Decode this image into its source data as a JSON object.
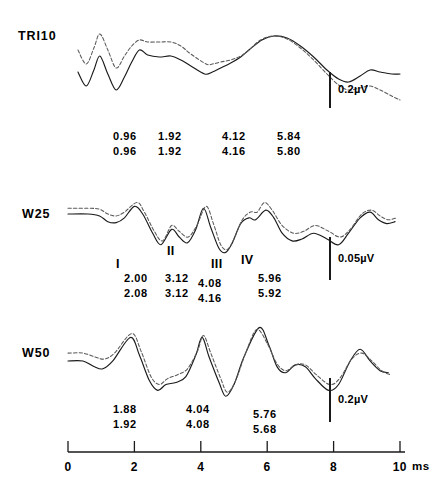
{
  "figure": {
    "type": "multi-panel-waveform",
    "background_color": "#ffffff",
    "solid_trace_color": "#1a1a1a",
    "dashed_trace_color": "#5a5a5a"
  },
  "axis": {
    "label_unit": "ms",
    "tick_labels": [
      "0",
      "2",
      "4",
      "6",
      "8",
      "10"
    ],
    "tick_values": [
      0,
      2,
      4,
      6,
      8,
      10
    ],
    "range": [
      0,
      10
    ],
    "pixel_x_start": 68,
    "pixel_x_end": 400
  },
  "panels": [
    {
      "id": "tri10",
      "title": "TRI10",
      "scale_bar": {
        "label": "0.2µV",
        "value": 0.2,
        "unit": "µV"
      },
      "latency_rows": [
        [
          "0.96",
          "1.92",
          "4.12",
          "5.84"
        ],
        [
          "0.96",
          "1.92",
          "4.16",
          "5.80"
        ]
      ],
      "peak_labels": []
    },
    {
      "id": "w25",
      "title": "W25",
      "scale_bar": {
        "label": "0.05µV",
        "value": 0.05,
        "unit": "µV"
      },
      "latency_rows": [
        [
          "2.00",
          "3.12",
          "4.08",
          "5.96"
        ],
        [
          "2.08",
          "3.12",
          "4.16",
          "5.92"
        ]
      ],
      "peak_labels": [
        "I",
        "II",
        "III",
        "IV"
      ]
    },
    {
      "id": "w50",
      "title": "W50",
      "scale_bar": {
        "label": "0.2µV",
        "value": 0.2,
        "unit": "µV"
      },
      "latency_rows": [
        [
          "1.88",
          "4.04",
          "5.76"
        ],
        [
          "1.92",
          "4.08",
          "5.68"
        ]
      ],
      "peak_labels": []
    }
  ],
  "chart_data": {
    "type": "line",
    "title": "",
    "xlabel": "ms",
    "ylabel": "",
    "xlim": [
      0,
      10
    ],
    "grid": false,
    "legend": "none",
    "panels": [
      {
        "name": "TRI10",
        "series": [
          {
            "name": "solid",
            "style": "solid",
            "points": [
              [
                0.3,
                40
              ],
              [
                0.55,
                26
              ],
              [
                0.78,
                42
              ],
              [
                0.96,
                56
              ],
              [
                1.2,
                38
              ],
              [
                1.45,
                22
              ],
              [
                1.7,
                35
              ],
              [
                1.92,
                50
              ],
              [
                2.15,
                62
              ],
              [
                2.4,
                57
              ],
              [
                2.75,
                55
              ],
              [
                3.1,
                56
              ],
              [
                3.4,
                52
              ],
              [
                3.7,
                46
              ],
              [
                4.12,
                38
              ],
              [
                4.35,
                40
              ],
              [
                4.6,
                44
              ],
              [
                4.9,
                49
              ],
              [
                5.2,
                55
              ],
              [
                5.45,
                62
              ],
              [
                5.84,
                72
              ],
              [
                6.2,
                76
              ],
              [
                6.6,
                74
              ],
              [
                7.0,
                66
              ],
              [
                7.4,
                55
              ],
              [
                7.8,
                42
              ],
              [
                8.15,
                33
              ],
              [
                8.45,
                30
              ],
              [
                8.8,
                36
              ],
              [
                9.1,
                42
              ],
              [
                9.4,
                40
              ],
              [
                9.75,
                38
              ],
              [
                10.0,
                38
              ]
            ]
          },
          {
            "name": "dashed",
            "style": "dashed",
            "points": [
              [
                0.3,
                62
              ],
              [
                0.55,
                48
              ],
              [
                0.78,
                64
              ],
              [
                0.96,
                78
              ],
              [
                1.2,
                62
              ],
              [
                1.45,
                44
              ],
              [
                1.7,
                56
              ],
              [
                1.92,
                66
              ],
              [
                2.15,
                72
              ],
              [
                2.4,
                70
              ],
              [
                2.75,
                70
              ],
              [
                3.1,
                70
              ],
              [
                3.4,
                66
              ],
              [
                3.7,
                58
              ],
              [
                4.16,
                48
              ],
              [
                4.35,
                48
              ],
              [
                4.6,
                50
              ],
              [
                4.9,
                52
              ],
              [
                5.2,
                56
              ],
              [
                5.45,
                62
              ],
              [
                5.8,
                72
              ],
              [
                6.2,
                76
              ],
              [
                6.6,
                73
              ],
              [
                7.0,
                64
              ],
              [
                7.4,
                52
              ],
              [
                7.8,
                38
              ],
              [
                8.15,
                27
              ],
              [
                8.45,
                22
              ],
              [
                8.8,
                24
              ],
              [
                9.1,
                26
              ],
              [
                9.4,
                22
              ],
              [
                9.75,
                16
              ],
              [
                10.0,
                12
              ]
            ]
          }
        ],
        "latency_markers": {
          "solid": [
            0.96,
            1.92,
            4.12,
            5.84
          ],
          "dashed": [
            0.96,
            1.92,
            4.16,
            5.8
          ]
        }
      },
      {
        "name": "W25",
        "series": [
          {
            "name": "solid",
            "style": "solid",
            "points": [
              [
                0.0,
                50
              ],
              [
                0.6,
                50
              ],
              [
                0.95,
                48
              ],
              [
                1.2,
                42
              ],
              [
                1.45,
                41
              ],
              [
                1.7,
                46
              ],
              [
                2.0,
                58
              ],
              [
                2.25,
                50
              ],
              [
                2.55,
                30
              ],
              [
                2.8,
                18
              ],
              [
                3.12,
                34
              ],
              [
                3.35,
                26
              ],
              [
                3.6,
                20
              ],
              [
                3.85,
                34
              ],
              [
                4.08,
                56
              ],
              [
                4.3,
                36
              ],
              [
                4.55,
                14
              ],
              [
                4.75,
                10
              ],
              [
                4.95,
                20
              ],
              [
                5.2,
                40
              ],
              [
                5.45,
                46
              ],
              [
                5.65,
                44
              ],
              [
                5.96,
                54
              ],
              [
                6.2,
                46
              ],
              [
                6.45,
                30
              ],
              [
                6.75,
                22
              ],
              [
                7.05,
                24
              ],
              [
                7.4,
                30
              ],
              [
                7.8,
                24
              ],
              [
                8.15,
                18
              ],
              [
                8.45,
                30
              ],
              [
                8.8,
                46
              ],
              [
                9.1,
                52
              ],
              [
                9.35,
                44
              ],
              [
                9.6,
                40
              ],
              [
                9.85,
                42
              ]
            ]
          },
          {
            "name": "dashed",
            "style": "dashed",
            "points": [
              [
                0.0,
                56
              ],
              [
                0.6,
                56
              ],
              [
                0.95,
                55
              ],
              [
                1.2,
                50
              ],
              [
                1.45,
                48
              ],
              [
                1.7,
                52
              ],
              [
                2.08,
                62
              ],
              [
                2.3,
                52
              ],
              [
                2.6,
                32
              ],
              [
                2.85,
                22
              ],
              [
                3.12,
                38
              ],
              [
                3.35,
                32
              ],
              [
                3.62,
                26
              ],
              [
                3.88,
                38
              ],
              [
                4.16,
                58
              ],
              [
                4.38,
                40
              ],
              [
                4.6,
                18
              ],
              [
                4.8,
                13
              ],
              [
                5.0,
                24
              ],
              [
                5.25,
                44
              ],
              [
                5.5,
                52
              ],
              [
                5.7,
                52
              ],
              [
                5.92,
                62
              ],
              [
                6.15,
                54
              ],
              [
                6.45,
                38
              ],
              [
                6.8,
                30
              ],
              [
                7.1,
                32
              ],
              [
                7.45,
                38
              ],
              [
                7.85,
                32
              ],
              [
                8.2,
                26
              ],
              [
                8.5,
                34
              ],
              [
                8.85,
                50
              ],
              [
                9.15,
                54
              ],
              [
                9.4,
                48
              ],
              [
                9.65,
                44
              ],
              [
                9.9,
                46
              ]
            ]
          }
        ],
        "latency_markers": {
          "solid": [
            2.0,
            3.12,
            4.08,
            5.96
          ],
          "dashed": [
            2.08,
            3.12,
            4.16,
            5.92
          ]
        },
        "peak_annotations": [
          {
            "label": "I",
            "latency": 1.95
          },
          {
            "label": "II",
            "latency": 3.1
          },
          {
            "label": "III",
            "latency": 4.25
          },
          {
            "label": "IV",
            "latency": 5.35
          }
        ]
      },
      {
        "name": "W50",
        "series": [
          {
            "name": "solid",
            "style": "solid",
            "points": [
              [
                0.0,
                48
              ],
              [
                0.45,
                48
              ],
              [
                0.8,
                42
              ],
              [
                1.05,
                40
              ],
              [
                1.35,
                48
              ],
              [
                1.88,
                72
              ],
              [
                2.15,
                54
              ],
              [
                2.45,
                28
              ],
              [
                2.7,
                18
              ],
              [
                2.95,
                24
              ],
              [
                3.25,
                26
              ],
              [
                3.55,
                32
              ],
              [
                3.85,
                54
              ],
              [
                4.04,
                72
              ],
              [
                4.25,
                52
              ],
              [
                4.55,
                26
              ],
              [
                4.75,
                12
              ],
              [
                5.0,
                24
              ],
              [
                5.3,
                52
              ],
              [
                5.76,
                82
              ],
              [
                6.05,
                64
              ],
              [
                6.3,
                42
              ],
              [
                6.55,
                36
              ],
              [
                6.85,
                44
              ],
              [
                7.15,
                42
              ],
              [
                7.45,
                30
              ],
              [
                7.85,
                18
              ],
              [
                8.15,
                24
              ],
              [
                8.5,
                48
              ],
              [
                8.8,
                60
              ],
              [
                9.1,
                48
              ],
              [
                9.4,
                38
              ],
              [
                9.65,
                36
              ]
            ]
          },
          {
            "name": "dashed",
            "style": "dashed",
            "points": [
              [
                0.0,
                56
              ],
              [
                0.45,
                56
              ],
              [
                0.82,
                52
              ],
              [
                1.1,
                50
              ],
              [
                1.4,
                56
              ],
              [
                1.92,
                76
              ],
              [
                2.2,
                58
              ],
              [
                2.5,
                32
              ],
              [
                2.75,
                24
              ],
              [
                3.0,
                30
              ],
              [
                3.3,
                34
              ],
              [
                3.6,
                40
              ],
              [
                3.9,
                58
              ],
              [
                4.08,
                74
              ],
              [
                4.3,
                56
              ],
              [
                4.6,
                30
              ],
              [
                4.8,
                16
              ],
              [
                5.05,
                28
              ],
              [
                5.35,
                56
              ],
              [
                5.68,
                80
              ],
              [
                6.0,
                66
              ],
              [
                6.28,
                46
              ],
              [
                6.55,
                38
              ],
              [
                6.85,
                44
              ],
              [
                7.15,
                44
              ],
              [
                7.48,
                34
              ],
              [
                7.88,
                24
              ],
              [
                8.18,
                30
              ],
              [
                8.55,
                50
              ],
              [
                8.85,
                56
              ],
              [
                9.15,
                48
              ],
              [
                9.45,
                38
              ],
              [
                9.7,
                34
              ]
            ]
          }
        ],
        "latency_markers": {
          "solid": [
            1.88,
            4.04,
            5.76
          ],
          "dashed": [
            1.92,
            4.08,
            5.68
          ]
        }
      }
    ]
  }
}
